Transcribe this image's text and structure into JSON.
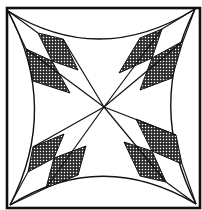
{
  "colors": {
    "background": "#ffffff",
    "stroke": "#111111",
    "hatch": "#222222"
  },
  "geometry": {
    "outer_square": {
      "x": 7,
      "y": 8,
      "w": 193,
      "h": 200
    },
    "center": [
      104,
      107
    ],
    "corners": {
      "tl": [
        8,
        11
      ],
      "tr": [
        195,
        9
      ],
      "bl": [
        10,
        205
      ],
      "br": [
        196,
        204
      ]
    }
  }
}
